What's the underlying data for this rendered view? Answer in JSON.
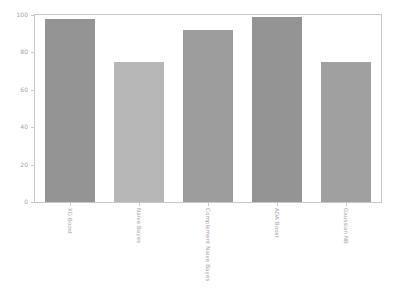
{
  "chart_data": {
    "type": "bar",
    "title": "",
    "xlabel": "",
    "ylabel": "",
    "ylim": [
      0,
      100
    ],
    "yticks": [
      0,
      20,
      40,
      60,
      80,
      100
    ],
    "ytick_labels": [
      "0",
      "20",
      "40",
      "60",
      "80",
      "100"
    ],
    "grid": false,
    "legend": false,
    "categories": [
      "XG Boost",
      "Naive Bayes",
      "Complement Naive Bayes",
      "ADA Boost",
      "Gaussian NB"
    ],
    "values": [
      98,
      75,
      92,
      99,
      75
    ],
    "bar_colors": [
      "#949494",
      "#b7b7b7",
      "#9d9d9d",
      "#949494",
      "#a0a0a0"
    ],
    "bar_width_ratio": 0.72,
    "axis_color": "#c8c8c8",
    "tick_label_color": "#a5a5a5"
  }
}
